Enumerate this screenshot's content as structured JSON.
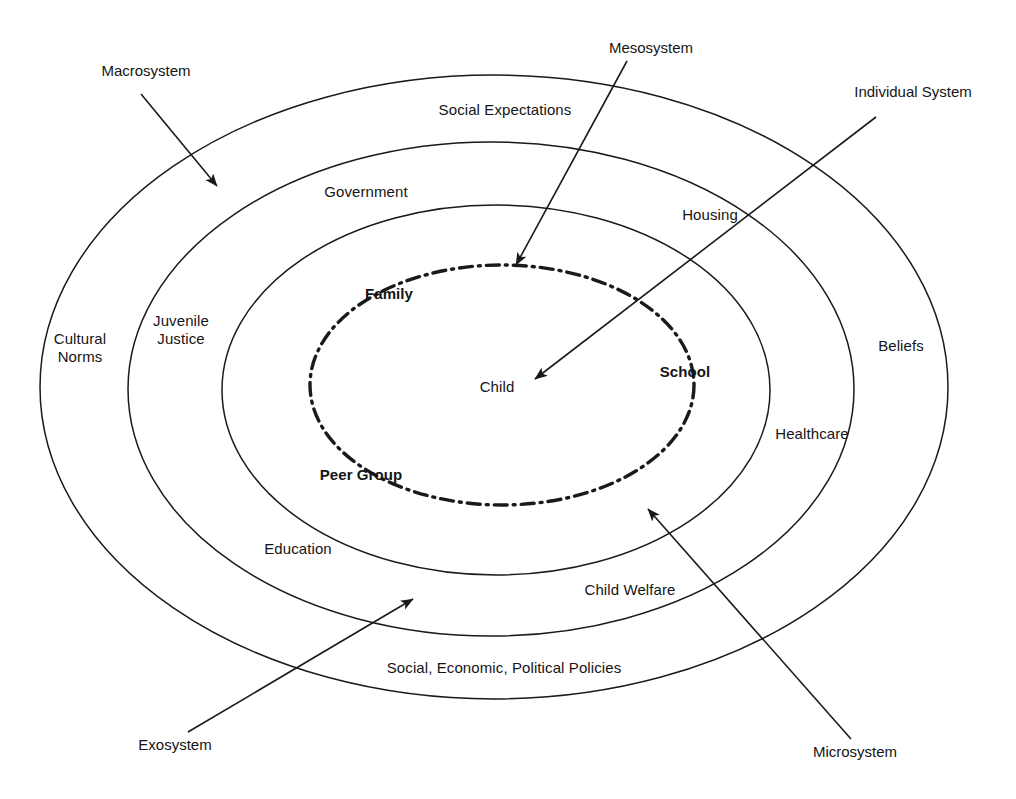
{
  "diagram": {
    "background_color": "#ffffff",
    "line_color": "#1a1a1a",
    "center": {
      "x": 494,
      "y": 387
    },
    "rings": [
      {
        "name": "macrosystem-ring",
        "callout": "Macrosystem",
        "style": "solid",
        "cx": 494,
        "cy": 387,
        "rx": 454,
        "ry": 312,
        "labels": [
          "Social Expectations",
          "Cultural Norms",
          "Beliefs",
          "Social, Economic, Political Policies"
        ]
      },
      {
        "name": "exosystem-ring",
        "callout": "Exosystem",
        "style": "solid",
        "cx": 491,
        "cy": 389,
        "rx": 363,
        "ry": 247,
        "labels": [
          "Government",
          "Juvenile Justice",
          "Healthcare",
          "Child Welfare"
        ]
      },
      {
        "name": "mesosystem-ring",
        "callout": "Mesosystem",
        "style": "solid",
        "cx": 496,
        "cy": 390,
        "rx": 274,
        "ry": 185,
        "labels": [
          "Housing",
          "Education"
        ]
      },
      {
        "name": "microsystem-ring",
        "callout": "Microsystem",
        "style": "dash-dot",
        "cx": 502,
        "cy": 385,
        "rx": 192,
        "ry": 120,
        "labels": [
          "Family",
          "Peer Group",
          "School"
        ]
      }
    ],
    "center_label": "Child",
    "ring_labels": [
      {
        "id": "social-expectations",
        "text": "Social Expectations",
        "x": 505,
        "y": 110,
        "bold": false
      },
      {
        "id": "government",
        "text": "Government",
        "x": 366,
        "y": 192,
        "bold": false
      },
      {
        "id": "housing",
        "text": "Housing",
        "x": 710,
        "y": 215,
        "bold": false
      },
      {
        "id": "cultural-norms",
        "text": "Cultural Norms",
        "x": 80,
        "y": 348,
        "bold": false
      },
      {
        "id": "juvenile-justice",
        "text": "Juvenile Justice",
        "x": 181,
        "y": 330,
        "bold": false
      },
      {
        "id": "beliefs",
        "text": "Beliefs",
        "x": 901,
        "y": 346,
        "bold": false
      },
      {
        "id": "family",
        "text": "Family",
        "x": 389,
        "y": 294,
        "bold": true
      },
      {
        "id": "school",
        "text": "School",
        "x": 685,
        "y": 372,
        "bold": true
      },
      {
        "id": "healthcare",
        "text": "Healthcare",
        "x": 812,
        "y": 434,
        "bold": false
      },
      {
        "id": "peer-group",
        "text": "Peer Group",
        "x": 361,
        "y": 475,
        "bold": true
      },
      {
        "id": "education",
        "text": "Education",
        "x": 298,
        "y": 549,
        "bold": false
      },
      {
        "id": "child-welfare",
        "text": "Child Welfare",
        "x": 630,
        "y": 590,
        "bold": false
      },
      {
        "id": "policies",
        "text": "Social, Economic, Political Policies",
        "x": 504,
        "y": 668,
        "bold": false
      },
      {
        "id": "child",
        "text": "Child",
        "x": 497,
        "y": 387,
        "bold": false
      }
    ],
    "callouts": [
      {
        "id": "macrosystem",
        "text": "Macrosystem",
        "label_x": 146,
        "label_y": 71,
        "arrow": {
          "x1": 141,
          "y1": 94,
          "x2": 217,
          "y2": 186
        }
      },
      {
        "id": "mesosystem",
        "text": "Mesosystem",
        "label_x": 651,
        "label_y": 48,
        "arrow": {
          "x1": 627,
          "y1": 61,
          "x2": 516,
          "y2": 265
        }
      },
      {
        "id": "individual-system",
        "text": "Individual System",
        "label_x": 913,
        "label_y": 92,
        "arrow": {
          "x1": 876,
          "y1": 117,
          "x2": 535,
          "y2": 379
        }
      },
      {
        "id": "exosystem",
        "text": "Exosystem",
        "label_x": 175,
        "label_y": 745,
        "arrow": {
          "x1": 188,
          "y1": 732,
          "x2": 413,
          "y2": 599
        }
      },
      {
        "id": "microsystem",
        "text": "Microsystem",
        "label_x": 855,
        "label_y": 752,
        "arrow": {
          "x1": 851,
          "y1": 739,
          "x2": 648,
          "y2": 509
        }
      }
    ]
  }
}
